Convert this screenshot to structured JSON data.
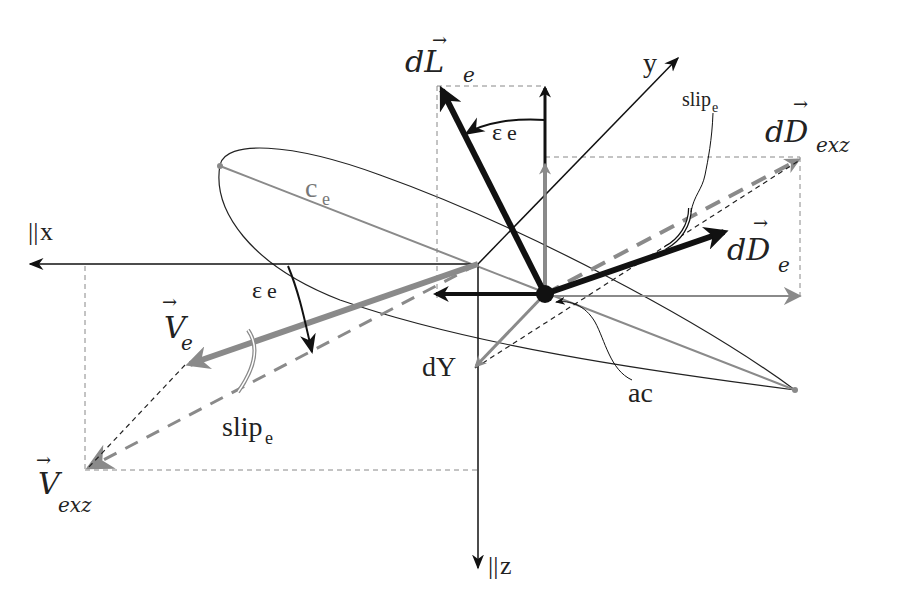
{
  "diagram": {
    "axes": {
      "x": {
        "prefix": "||",
        "label": "x"
      },
      "y": {
        "label": "y"
      },
      "z": {
        "prefix": "||",
        "label": "z"
      }
    },
    "vectors": {
      "dL_e": {
        "base": "dL",
        "arrow": "→",
        "sub": "e"
      },
      "dD_exz": {
        "base": "dD",
        "arrow": "→",
        "sub": "exz"
      },
      "dD_e": {
        "base": "dD",
        "arrow": "→",
        "sub": "e"
      },
      "V_e": {
        "base": "V",
        "arrow": "→",
        "sub": "e"
      },
      "V_exz": {
        "base": "V",
        "arrow": "→",
        "sub": "exz"
      },
      "dY": {
        "label": "dY"
      }
    },
    "angles": {
      "eps_top": {
        "symbol": "ε",
        "sub": "e"
      },
      "eps_left": {
        "symbol": "ε",
        "sub": "e"
      },
      "slip_top": {
        "base": "slip",
        "sub": "e"
      },
      "slip_bottom": {
        "base": "slip",
        "sub": "e"
      }
    },
    "annotations": {
      "chord": {
        "base": "c",
        "sub": "e"
      },
      "aero_center": {
        "label": "ac"
      }
    },
    "colors": {
      "black": "#111111",
      "gray": "#8a8a8a",
      "dashed": "#777777"
    }
  }
}
